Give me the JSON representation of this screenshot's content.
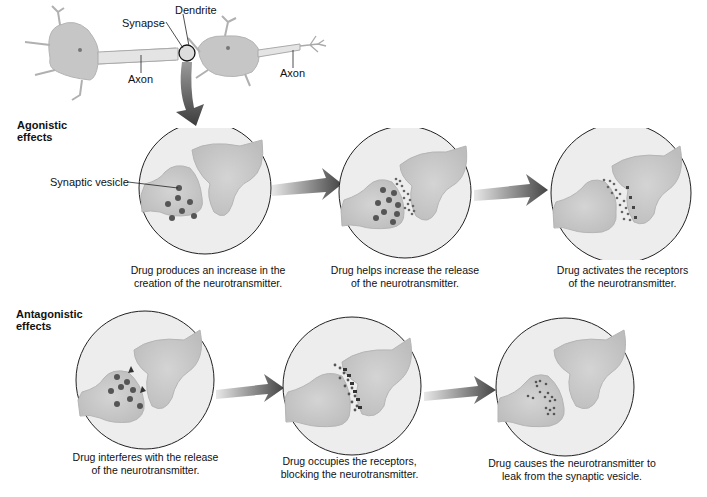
{
  "neuron_overview": {
    "labels": {
      "dendrite": "Dendrite",
      "synapse": "Synapse",
      "axon_left": "Axon",
      "axon_right": "Axon"
    }
  },
  "agonistic": {
    "title_line1": "Agonistic",
    "title_line2": "effects",
    "vesicle_label": "Synaptic vesicle",
    "panels": [
      {
        "caption_line1": "Drug produces an increase in the",
        "caption_line2": "creation of the neurotransmitter."
      },
      {
        "caption_line1": "Drug helps increase the release",
        "caption_line2": "of the neurotransmitter."
      },
      {
        "caption_line1": "Drug activates the receptors",
        "caption_line2": "of the neurotransmitter."
      }
    ]
  },
  "antagonistic": {
    "title_line1": "Antagonistic",
    "title_line2": "effects",
    "panels": [
      {
        "caption_line1": "Drug interferes with the release",
        "caption_line2": "of the neurotransmitter."
      },
      {
        "caption_line1": "Drug occupies the receptors,",
        "caption_line2": "blocking the neurotransmitter."
      },
      {
        "caption_line1": "Drug causes the neurotransmitter to",
        "caption_line2": "leak from the synaptic vesicle."
      }
    ]
  },
  "colors": {
    "cell_fill": "#c9c9c9",
    "circle_bg": "#ececec",
    "vesicle": "#555555",
    "arrow_dark": "#4a4a4a"
  }
}
